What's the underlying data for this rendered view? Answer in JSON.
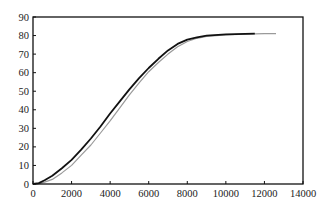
{
  "chart_data": {
    "type": "line",
    "title": "",
    "xlabel": "",
    "ylabel": "",
    "xlim": [
      0,
      14000
    ],
    "ylim": [
      0,
      90
    ],
    "grid": false,
    "legend": null,
    "x_ticks": [
      "0",
      "2000",
      "4000",
      "6000",
      "8000",
      "10000",
      "12000",
      "14000"
    ],
    "y_ticks": [
      "0",
      "10",
      "20",
      "30",
      "40",
      "50",
      "60",
      "70",
      "80",
      "90"
    ],
    "series": [
      {
        "name": "black",
        "color": "#111111",
        "width": 1.8,
        "x": [
          0,
          300,
          600,
          1000,
          1500,
          2000,
          2500,
          3000,
          3500,
          4000,
          4500,
          5000,
          5500,
          6000,
          6500,
          7000,
          7500,
          8000,
          8500,
          9000,
          10000,
          11000,
          11500
        ],
        "y": [
          0,
          0.5,
          2,
          4.5,
          8.5,
          13,
          18.5,
          24.5,
          31,
          38,
          44.5,
          51,
          57,
          62.5,
          67.5,
          72,
          75.5,
          77.8,
          79,
          80,
          80.6,
          80.9,
          81
        ]
      },
      {
        "name": "gray",
        "color": "#9a9a9a",
        "width": 1.2,
        "x": [
          0,
          300,
          600,
          1000,
          1500,
          2000,
          2500,
          3000,
          3500,
          4000,
          4500,
          5000,
          5500,
          6000,
          6500,
          7000,
          7500,
          8000,
          8500,
          9000,
          10000,
          11000,
          12000,
          12600
        ],
        "y": [
          0,
          0.2,
          1,
          2.5,
          6,
          10,
          15.5,
          21,
          27.5,
          34,
          41,
          48,
          54.5,
          60.5,
          65.5,
          70,
          74,
          76.8,
          78.5,
          79.5,
          80.4,
          80.8,
          81,
          81
        ]
      }
    ]
  }
}
